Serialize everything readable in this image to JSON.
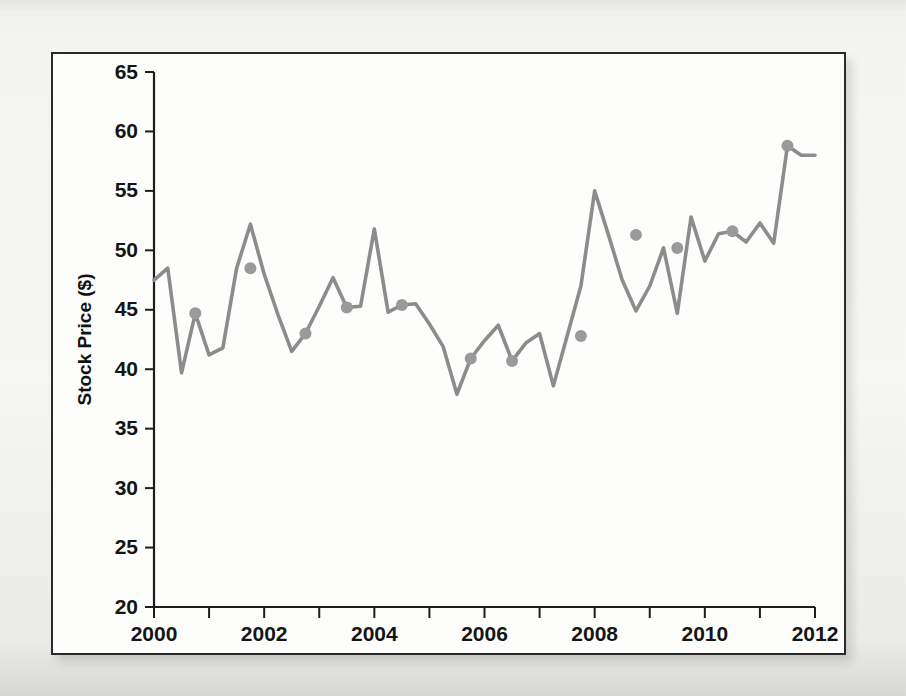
{
  "figure": {
    "background_color": "#fdfdfc",
    "frame_color": "#2a2a2a",
    "page_color": "#f2f2f0"
  },
  "bleed_through": {
    "top": "",
    "mid_line_1": "",
    "mid_line_2": ""
  },
  "chart_data": {
    "type": "line",
    "title": "",
    "xlabel": "",
    "ylabel": "Stock Price ($)",
    "xlim": [
      2000,
      2012
    ],
    "ylim": [
      20,
      65
    ],
    "ytick_step": 5,
    "xtick_step": 2,
    "x_minor_tick_step": 1,
    "grid": false,
    "legend": false,
    "line_color": "#8c8c8c",
    "marker_color": "#9a9a9a",
    "marker_radius": 6,
    "yticks": [
      20,
      25,
      30,
      35,
      40,
      45,
      50,
      55,
      60,
      65
    ],
    "ytick_labels": [
      "20",
      "25",
      "30",
      "35",
      "40",
      "45",
      "50",
      "55",
      "60",
      "65"
    ],
    "xticks": [
      2000,
      2002,
      2004,
      2006,
      2008,
      2010,
      2012
    ],
    "xtick_labels": [
      "2000",
      "2002",
      "2004",
      "2006",
      "2008",
      "2010",
      "2012"
    ],
    "x_minor_ticks": [
      2001,
      2003,
      2005,
      2007,
      2009,
      2011
    ],
    "series": [
      {
        "name": "Stock Price",
        "x": [
          2000.0,
          2000.25,
          2000.5,
          2000.75,
          2001.0,
          2001.25,
          2001.5,
          2001.75,
          2002.0,
          2002.25,
          2002.5,
          2002.75,
          2003.0,
          2003.25,
          2003.5,
          2003.75,
          2004.0,
          2004.25,
          2004.5,
          2004.75,
          2005.0,
          2005.25,
          2005.5,
          2005.75,
          2006.0,
          2006.25,
          2006.5,
          2006.75,
          2007.0,
          2007.25,
          2007.5,
          2007.75,
          2008.0,
          2008.25,
          2008.5,
          2008.75,
          2009.0,
          2009.25,
          2009.5,
          2009.75,
          2010.0,
          2010.25,
          2010.5,
          2010.75,
          2011.0,
          2011.25,
          2011.5,
          2011.75,
          2012.0
        ],
        "y": [
          47.5,
          48.5,
          39.7,
          44.7,
          41.2,
          41.8,
          48.5,
          52.2,
          48.0,
          44.6,
          41.5,
          43.0,
          45.3,
          47.7,
          45.2,
          45.3,
          51.8,
          44.8,
          45.4,
          45.5,
          43.8,
          41.9,
          37.9,
          40.9,
          42.4,
          43.7,
          40.7,
          42.2,
          43.0,
          38.6,
          42.8,
          47.0,
          55.0,
          51.3,
          47.5,
          44.9,
          47.0,
          50.2,
          44.7,
          52.8,
          49.1,
          51.4,
          51.6,
          50.7,
          52.3,
          50.6,
          58.8,
          58.0,
          58.0
        ],
        "marker_x": [
          2000.75,
          2001.75,
          2002.75,
          2003.5,
          2004.5,
          2005.75,
          2006.5,
          2007.75,
          2008.75,
          2009.5,
          2010.5,
          2011.5
        ],
        "marker_y": [
          44.7,
          48.5,
          43.0,
          45.2,
          45.4,
          40.9,
          40.7,
          42.8,
          51.3,
          50.2,
          51.6,
          58.8
        ]
      }
    ]
  }
}
